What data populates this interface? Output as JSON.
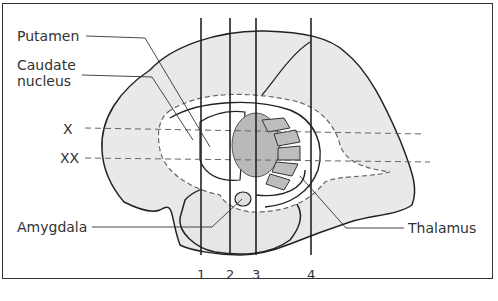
{
  "diagram": {
    "type": "anatomical-illustration",
    "labels": {
      "putamen": "Putamen",
      "caudate_line1": "Caudate",
      "caudate_line2": "nucleus",
      "amygdala": "Amygdala",
      "thalamus": "Thalamus",
      "plane_x": "X",
      "plane_xx": "XX"
    },
    "section_lines": [
      "1",
      "2",
      "3",
      "4"
    ],
    "colors": {
      "brain_fill": "#e8e8e8",
      "putamen_fill": "#b8b8b8",
      "stroke": "#222222",
      "dashed": "#666666"
    }
  }
}
